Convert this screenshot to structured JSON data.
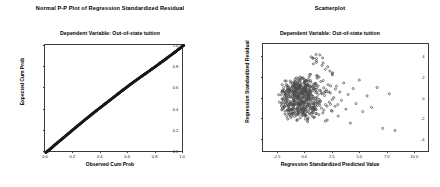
{
  "figures": [
    {
      "id": "ppplot",
      "title": "Normal P-P Plot of Regression Standardized Residual",
      "subtitle": "Dependent Variable: Out-of-state tuition"
    },
    {
      "id": "scatter",
      "title": "Scatterplot",
      "subtitle": "Dependent Variable: Out-of-state tuition"
    }
  ],
  "chart_data": [
    {
      "type": "scatter",
      "id": "normal-pp-plot",
      "title": "Normal P-P Plot of Regression Standardized Residual",
      "subtitle": "Dependent Variable: Out-of-state tuition",
      "xlabel": "Observed Cum Prob",
      "ylabel": "Expected Cum Prob",
      "xlim": [
        0.0,
        1.0
      ],
      "ylim": [
        0.0,
        1.0
      ],
      "xticks": [
        "0.0",
        "0.2",
        "0.4",
        "0.6",
        "0.8",
        "1.0"
      ],
      "xtick_values": [
        0.0,
        0.2,
        0.4,
        0.6,
        0.8,
        1.0
      ],
      "yticks": [
        "0.0",
        "0.2",
        "0.4",
        "0.6",
        "0.8",
        "1.0"
      ],
      "ytick_values": [
        0.0,
        0.2,
        0.4,
        0.6,
        0.8,
        1.0
      ],
      "grid": false,
      "legend": "none",
      "marker": "filled-circle",
      "marker_color": "#1a1a1a",
      "description": "Dense band of points lying essentially along the 45-degree reference diagonal, bowing very slightly above the line between 0.2 and 0.6.",
      "points": [
        [
          0.005,
          0.004
        ],
        [
          0.015,
          0.013
        ],
        [
          0.025,
          0.023
        ],
        [
          0.035,
          0.034
        ],
        [
          0.045,
          0.045
        ],
        [
          0.055,
          0.056
        ],
        [
          0.065,
          0.068
        ],
        [
          0.075,
          0.079
        ],
        [
          0.085,
          0.09
        ],
        [
          0.095,
          0.101
        ],
        [
          0.108,
          0.114
        ],
        [
          0.12,
          0.127
        ],
        [
          0.132,
          0.14
        ],
        [
          0.144,
          0.153
        ],
        [
          0.156,
          0.166
        ],
        [
          0.168,
          0.179
        ],
        [
          0.18,
          0.192
        ],
        [
          0.192,
          0.205
        ],
        [
          0.205,
          0.219
        ],
        [
          0.218,
          0.233
        ],
        [
          0.23,
          0.246
        ],
        [
          0.242,
          0.259
        ],
        [
          0.255,
          0.272
        ],
        [
          0.268,
          0.286
        ],
        [
          0.28,
          0.299
        ],
        [
          0.292,
          0.312
        ],
        [
          0.305,
          0.325
        ],
        [
          0.318,
          0.338
        ],
        [
          0.33,
          0.351
        ],
        [
          0.342,
          0.364
        ],
        [
          0.355,
          0.377
        ],
        [
          0.368,
          0.39
        ],
        [
          0.38,
          0.402
        ],
        [
          0.392,
          0.414
        ],
        [
          0.405,
          0.427
        ],
        [
          0.418,
          0.44
        ],
        [
          0.43,
          0.452
        ],
        [
          0.442,
          0.464
        ],
        [
          0.455,
          0.477
        ],
        [
          0.468,
          0.49
        ],
        [
          0.48,
          0.502
        ],
        [
          0.492,
          0.514
        ],
        [
          0.505,
          0.527
        ],
        [
          0.518,
          0.54
        ],
        [
          0.53,
          0.552
        ],
        [
          0.542,
          0.564
        ],
        [
          0.555,
          0.577
        ],
        [
          0.568,
          0.589
        ],
        [
          0.58,
          0.601
        ],
        [
          0.592,
          0.613
        ],
        [
          0.605,
          0.626
        ],
        [
          0.618,
          0.638
        ],
        [
          0.63,
          0.65
        ],
        [
          0.642,
          0.661
        ],
        [
          0.655,
          0.673
        ],
        [
          0.668,
          0.685
        ],
        [
          0.68,
          0.696
        ],
        [
          0.692,
          0.707
        ],
        [
          0.705,
          0.719
        ],
        [
          0.718,
          0.73
        ],
        [
          0.73,
          0.741
        ],
        [
          0.742,
          0.752
        ],
        [
          0.755,
          0.764
        ],
        [
          0.768,
          0.776
        ],
        [
          0.78,
          0.787
        ],
        [
          0.792,
          0.798
        ],
        [
          0.805,
          0.81
        ],
        [
          0.818,
          0.822
        ],
        [
          0.83,
          0.834
        ],
        [
          0.842,
          0.845
        ],
        [
          0.855,
          0.857
        ],
        [
          0.868,
          0.869
        ],
        [
          0.88,
          0.881
        ],
        [
          0.892,
          0.893
        ],
        [
          0.905,
          0.905
        ],
        [
          0.918,
          0.917
        ],
        [
          0.93,
          0.929
        ],
        [
          0.942,
          0.941
        ],
        [
          0.955,
          0.954
        ],
        [
          0.968,
          0.966
        ],
        [
          0.978,
          0.977
        ],
        [
          0.986,
          0.986
        ],
        [
          0.993,
          0.993
        ],
        [
          0.999,
          0.999
        ]
      ]
    },
    {
      "type": "scatter",
      "id": "residual-scatterplot",
      "title": "Scatterplot",
      "subtitle": "Dependent Variable: Out-of-state tuition",
      "xlabel": "Regression Standardized Predicted Value",
      "ylabel": "Regression Standardized Residual",
      "xlim": [
        -3.75,
        11.25
      ],
      "ylim": [
        -5.2,
        5.2
      ],
      "xticks": [
        "-2.5",
        "0.0",
        "2.5",
        "5.0",
        "7.5",
        "10.0"
      ],
      "xtick_values": [
        -2.5,
        0.0,
        2.5,
        5.0,
        7.5,
        10.0
      ],
      "yticks": [
        "4",
        "2",
        "0",
        "-2",
        "-4"
      ],
      "ytick_values": [
        4,
        2,
        0,
        -2,
        -4
      ],
      "grid": false,
      "legend": "none",
      "marker": "open-circle",
      "marker_color": "#4a4a4a",
      "description": "Dense heteroscedastic cloud of roughly 430 residuals centered near x = -0.3, y = 0, fanning outward to the right with sparse positive-predicted-value outliers extending to x = 8 and residuals near -3.",
      "n_points": 430,
      "points": [
        [
          -2.1,
          0.35
        ],
        [
          -2.05,
          -0.42
        ],
        [
          -1.95,
          0.72
        ],
        [
          -1.92,
          -0.18
        ],
        [
          -1.88,
          1.05
        ],
        [
          -1.85,
          -0.85
        ],
        [
          -1.8,
          0.22
        ],
        [
          -1.78,
          -1.2
        ],
        [
          -1.74,
          0.6
        ],
        [
          -1.7,
          -0.35
        ],
        [
          -1.66,
          1.32
        ],
        [
          -1.62,
          0.05
        ],
        [
          -1.58,
          -0.72
        ],
        [
          -1.55,
          0.88
        ],
        [
          -1.52,
          -1.45
        ],
        [
          -1.48,
          0.4
        ],
        [
          -1.45,
          -0.22
        ],
        [
          -1.42,
          1.12
        ],
        [
          -1.38,
          -0.95
        ],
        [
          -1.35,
          0.55
        ],
        [
          -1.32,
          -1.62
        ],
        [
          -1.28,
          0.18
        ],
        [
          -1.25,
          1.48
        ],
        [
          -1.22,
          -0.48
        ],
        [
          -1.2,
          0.78
        ],
        [
          -1.18,
          -1.08
        ],
        [
          -1.15,
          0.3
        ],
        [
          -1.12,
          -0.62
        ],
        [
          -1.1,
          1.22
        ],
        [
          -1.08,
          -1.35
        ],
        [
          -1.05,
          0.65
        ],
        [
          -1.02,
          0.02
        ],
        [
          -1.0,
          -0.88
        ],
        [
          -0.98,
          1.58
        ],
        [
          -0.96,
          -0.28
        ],
        [
          -0.94,
          0.95
        ],
        [
          -0.92,
          -1.72
        ],
        [
          -0.9,
          0.45
        ],
        [
          -0.88,
          -0.55
        ],
        [
          -0.86,
          1.28
        ],
        [
          -0.84,
          -1.18
        ],
        [
          -0.82,
          0.1
        ],
        [
          -0.8,
          0.82
        ],
        [
          -0.78,
          -0.38
        ],
        [
          -0.76,
          1.68
        ],
        [
          -0.74,
          -0.98
        ],
        [
          -0.72,
          0.52
        ],
        [
          -0.7,
          -1.52
        ],
        [
          -0.68,
          1.02
        ],
        [
          -0.66,
          -0.08
        ],
        [
          -0.64,
          0.7
        ],
        [
          -0.62,
          -0.68
        ],
        [
          -0.6,
          1.38
        ],
        [
          -0.58,
          -1.28
        ],
        [
          -0.56,
          0.25
        ],
        [
          -0.54,
          0.92
        ],
        [
          -0.52,
          -0.45
        ],
        [
          -0.5,
          1.78
        ],
        [
          -0.48,
          -0.78
        ],
        [
          -0.46,
          0.38
        ],
        [
          -0.44,
          -1.88
        ],
        [
          -0.42,
          1.15
        ],
        [
          -0.4,
          -0.15
        ],
        [
          -0.38,
          0.62
        ],
        [
          -0.36,
          -0.58
        ],
        [
          -0.34,
          1.45
        ],
        [
          -0.32,
          -1.05
        ],
        [
          -0.3,
          0.08
        ],
        [
          -0.28,
          0.85
        ],
        [
          -0.26,
          -0.32
        ],
        [
          -0.24,
          1.92
        ],
        [
          -0.22,
          -0.88
        ],
        [
          -0.2,
          0.48
        ],
        [
          -0.18,
          -1.42
        ],
        [
          -0.16,
          1.08
        ],
        [
          -0.14,
          0.15
        ],
        [
          -0.12,
          -0.65
        ],
        [
          -0.1,
          0.75
        ],
        [
          -0.08,
          -1.15
        ],
        [
          -0.06,
          1.52
        ],
        [
          -0.04,
          -0.25
        ],
        [
          -0.02,
          0.98
        ],
        [
          0.0,
          -0.52
        ],
        [
          0.02,
          1.25
        ],
        [
          0.04,
          -1.62
        ],
        [
          0.06,
          0.32
        ],
        [
          0.08,
          0.68
        ],
        [
          0.1,
          -0.95
        ],
        [
          0.12,
          1.72
        ],
        [
          0.14,
          -0.18
        ],
        [
          0.16,
          0.55
        ],
        [
          0.18,
          -1.25
        ],
        [
          0.2,
          1.18
        ],
        [
          0.22,
          0.05
        ],
        [
          0.24,
          -0.72
        ],
        [
          0.26,
          0.88
        ],
        [
          0.28,
          -1.95
        ],
        [
          0.3,
          1.35
        ],
        [
          0.32,
          -0.42
        ],
        [
          0.34,
          0.42
        ],
        [
          0.36,
          -1.08
        ],
        [
          0.38,
          2.05
        ],
        [
          0.4,
          0.22
        ],
        [
          0.42,
          -0.62
        ],
        [
          0.44,
          1.05
        ],
        [
          0.46,
          -1.48
        ],
        [
          0.48,
          0.72
        ],
        [
          0.5,
          -0.08
        ],
        [
          0.54,
          1.58
        ],
        [
          0.58,
          -0.82
        ],
        [
          0.62,
          0.35
        ],
        [
          0.66,
          -1.32
        ],
        [
          0.7,
          1.12
        ],
        [
          0.74,
          0.18
        ],
        [
          0.78,
          -0.55
        ],
        [
          0.82,
          0.92
        ],
        [
          0.86,
          -1.78
        ],
        [
          0.9,
          1.42
        ],
        [
          0.94,
          -0.28
        ],
        [
          0.98,
          0.58
        ],
        [
          1.02,
          -1.02
        ],
        [
          1.06,
          2.18
        ],
        [
          1.1,
          0.12
        ],
        [
          1.14,
          -0.68
        ],
        [
          1.2,
          1.22
        ],
        [
          1.26,
          -1.55
        ],
        [
          1.32,
          0.78
        ],
        [
          1.38,
          -0.22
        ],
        [
          1.44,
          1.62
        ],
        [
          1.5,
          -0.92
        ],
        [
          1.56,
          0.45
        ],
        [
          1.62,
          -1.38
        ],
        [
          1.7,
          1.02
        ],
        [
          1.78,
          0.28
        ],
        [
          1.86,
          -0.58
        ],
        [
          1.94,
          0.82
        ],
        [
          2.02,
          -2.05
        ],
        [
          2.1,
          1.32
        ],
        [
          2.2,
          -0.35
        ],
        [
          2.3,
          0.52
        ],
        [
          2.4,
          -1.15
        ],
        [
          2.5,
          2.45
        ],
        [
          2.6,
          0.08
        ],
        [
          2.72,
          -0.75
        ],
        [
          2.85,
          1.18
        ],
        [
          3.0,
          -1.68
        ],
        [
          3.15,
          0.62
        ],
        [
          3.3,
          -0.18
        ],
        [
          3.5,
          1.48
        ],
        [
          3.7,
          -1.02
        ],
        [
          3.9,
          0.38
        ],
        [
          4.1,
          -2.35
        ],
        [
          4.35,
          0.95
        ],
        [
          4.6,
          -0.48
        ],
        [
          4.9,
          1.75
        ],
        [
          5.2,
          -1.25
        ],
        [
          5.6,
          0.25
        ],
        [
          6.0,
          -0.85
        ],
        [
          6.5,
          1.05
        ],
        [
          7.0,
          -2.85
        ],
        [
          7.6,
          0.45
        ],
        [
          8.1,
          -3.05
        ],
        [
          1.55,
          3.15
        ],
        [
          1.05,
          3.45
        ],
        [
          1.85,
          2.78
        ],
        [
          0.75,
          3.85
        ],
        [
          2.25,
          2.62
        ],
        [
          1.35,
          4.15
        ]
      ]
    }
  ]
}
